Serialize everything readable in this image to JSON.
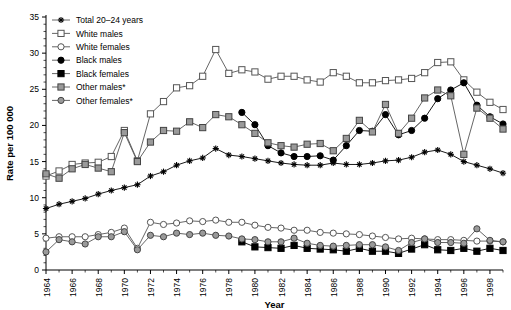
{
  "chart_data": {
    "type": "line",
    "title": "",
    "xlabel": "Year",
    "ylabel": "Rate per 100 000",
    "xlim": [
      1964,
      1999
    ],
    "ylim": [
      0,
      35
    ],
    "yticks": [
      0,
      5,
      10,
      15,
      20,
      25,
      30,
      35
    ],
    "xticks_labeled": [
      1964,
      1966,
      1968,
      1970,
      1972,
      1974,
      1976,
      1978,
      1980,
      1982,
      1984,
      1986,
      1988,
      1990,
      1992,
      1994,
      1996,
      1998
    ],
    "grid": false,
    "legend_position": "top-left",
    "footnote_marker": "*",
    "x": [
      1964,
      1965,
      1966,
      1967,
      1968,
      1969,
      1970,
      1971,
      1972,
      1973,
      1974,
      1975,
      1976,
      1977,
      1978,
      1979,
      1980,
      1981,
      1982,
      1983,
      1984,
      1985,
      1986,
      1987,
      1988,
      1989,
      1990,
      1991,
      1992,
      1993,
      1994,
      1995,
      1996,
      1997,
      1998,
      1999
    ],
    "series": [
      {
        "name": "Total 20-24 years",
        "label": "Total 20–24 years",
        "marker": "star",
        "fill": "#000000",
        "stroke": "#000000",
        "values": [
          8.5,
          9.1,
          9.5,
          9.9,
          10.5,
          11.0,
          11.4,
          11.8,
          13.0,
          13.6,
          14.5,
          15.1,
          15.5,
          16.8,
          15.9,
          15.7,
          15.4,
          15.1,
          14.8,
          14.6,
          14.5,
          14.5,
          14.8,
          14.6,
          14.6,
          14.8,
          15.1,
          15.2,
          15.6,
          16.3,
          16.6,
          16.0,
          15.0,
          14.5,
          14.0,
          13.4
        ]
      },
      {
        "name": "White males",
        "label": "White males",
        "marker": "open-square",
        "fill": "#ffffff",
        "stroke": "#555555",
        "values": [
          13.0,
          13.7,
          14.6,
          14.8,
          14.9,
          15.7,
          19.3,
          15.1,
          21.6,
          23.3,
          25.2,
          25.5,
          26.8,
          30.5,
          27.2,
          27.7,
          27.4,
          26.4,
          26.8,
          26.8,
          26.3,
          26.0,
          27.3,
          26.8,
          25.9,
          25.9,
          26.2,
          26.3,
          26.5,
          27.3,
          28.7,
          28.8,
          26.3,
          24.6,
          23.2,
          22.2
        ]
      },
      {
        "name": "White females",
        "label": "White females",
        "marker": "open-circle",
        "fill": "#ffffff",
        "stroke": "#555555",
        "values": [
          4.4,
          4.6,
          4.6,
          4.6,
          4.9,
          5.2,
          5.8,
          3.0,
          6.6,
          6.3,
          6.5,
          6.8,
          6.7,
          6.9,
          6.6,
          6.6,
          6.2,
          5.9,
          5.8,
          5.5,
          5.5,
          5.2,
          5.1,
          5.0,
          4.9,
          4.7,
          4.5,
          4.3,
          4.4,
          4.3,
          4.2,
          4.2,
          4.1,
          4.0,
          4.0,
          3.9
        ]
      },
      {
        "name": "Black males",
        "label": "Black males",
        "marker": "filled-circle",
        "fill": "#000000",
        "stroke": "#000000",
        "values": [
          null,
          null,
          null,
          null,
          null,
          null,
          null,
          null,
          null,
          null,
          null,
          null,
          null,
          null,
          null,
          21.8,
          20.1,
          17.2,
          16.2,
          15.7,
          15.7,
          15.8,
          15.2,
          17.2,
          19.3,
          19.2,
          21.5,
          18.7,
          19.3,
          21.0,
          23.7,
          24.9,
          25.9,
          22.8,
          21.2,
          20.2
        ]
      },
      {
        "name": "Black females",
        "label": "Black females",
        "marker": "filled-square",
        "fill": "#000000",
        "stroke": "#000000",
        "values": [
          null,
          null,
          null,
          null,
          null,
          null,
          null,
          null,
          null,
          null,
          null,
          null,
          null,
          null,
          null,
          3.9,
          3.2,
          3.1,
          3.0,
          3.4,
          3.0,
          2.9,
          2.8,
          2.6,
          3.0,
          2.6,
          2.6,
          2.3,
          2.9,
          3.5,
          2.8,
          2.7,
          3.0,
          2.6,
          3.0,
          2.7
        ]
      },
      {
        "name": "Other males*",
        "label": "Other males*",
        "marker": "gray-square",
        "fill": "#9a9a9a",
        "stroke": "#555555",
        "values": [
          13.3,
          12.7,
          14.0,
          14.6,
          14.1,
          13.6,
          19.0,
          15.0,
          17.7,
          19.3,
          19.2,
          20.5,
          19.7,
          21.5,
          21.2,
          20.1,
          18.9,
          17.6,
          17.2,
          17.0,
          17.4,
          17.5,
          16.5,
          18.2,
          20.7,
          19.1,
          22.9,
          18.9,
          21.0,
          23.8,
          24.9,
          24.1,
          16.0,
          22.4,
          21.0,
          19.5
        ]
      },
      {
        "name": "Other females*",
        "label": "Other females*",
        "marker": "gray-circle",
        "fill": "#9a9a9a",
        "stroke": "#555555",
        "values": [
          2.5,
          4.2,
          3.9,
          3.6,
          4.6,
          4.6,
          5.3,
          2.8,
          4.8,
          4.6,
          5.1,
          4.9,
          5.1,
          4.8,
          4.7,
          4.3,
          4.2,
          3.9,
          3.9,
          4.4,
          3.7,
          3.4,
          3.3,
          3.4,
          3.5,
          3.5,
          3.2,
          2.7,
          3.8,
          4.3,
          3.8,
          3.8,
          3.7,
          5.7,
          4.1,
          3.9
        ]
      }
    ]
  },
  "legend": {
    "items": [
      {
        "label": "Total 20–24 years",
        "marker": "star"
      },
      {
        "label": "White males",
        "marker": "open-square"
      },
      {
        "label": "White females",
        "marker": "open-circle"
      },
      {
        "label": "Black males",
        "marker": "filled-circle"
      },
      {
        "label": "Black females",
        "marker": "filled-square"
      },
      {
        "label": "Other males*",
        "marker": "gray-square"
      },
      {
        "label": "Other females*",
        "marker": "gray-circle"
      }
    ]
  },
  "colors": {
    "axis": "#000000",
    "open_marker_fill": "#ffffff",
    "gray_marker_fill": "#9a9a9a",
    "line": "#555555",
    "black": "#000000",
    "background": "#ffffff"
  }
}
